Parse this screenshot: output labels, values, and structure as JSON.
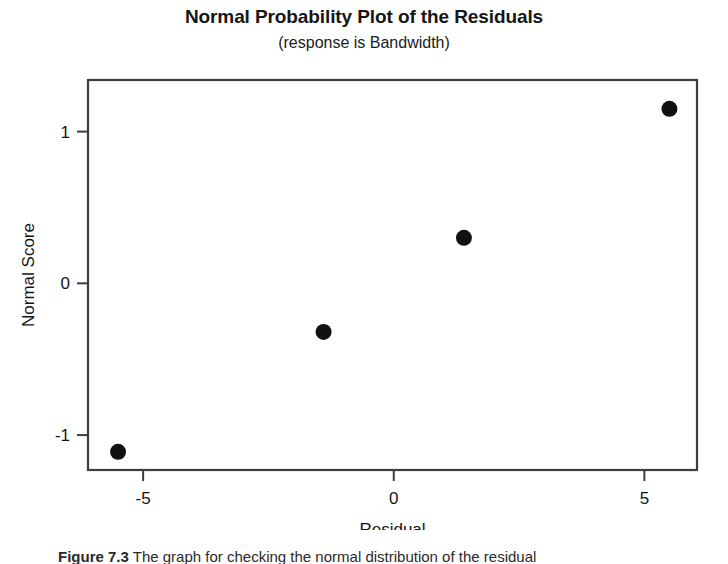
{
  "chart_data": {
    "type": "scatter",
    "title": "Normal Probability Plot of the Residuals",
    "subtitle": "(response is Bandwidth)",
    "xlabel": "Residual",
    "ylabel": "Normal Score",
    "xlim": [
      -6.1,
      6.05
    ],
    "ylim": [
      -1.23,
      1.34
    ],
    "xticks": [
      -5,
      0,
      5
    ],
    "xticklabels": [
      "-5",
      "0",
      "5"
    ],
    "yticks": [
      -1,
      0,
      1
    ],
    "yticklabels": [
      "-1",
      "0",
      "1"
    ],
    "grid": false,
    "legend": "none",
    "marker": "filled-circle",
    "marker_color": "#111111",
    "points": [
      {
        "x": -5.5,
        "y": -1.11
      },
      {
        "x": -1.4,
        "y": -0.32
      },
      {
        "x": 1.4,
        "y": 0.3
      },
      {
        "x": 5.5,
        "y": 1.15
      }
    ],
    "x": [
      -5.5,
      -1.4,
      1.4,
      5.5
    ],
    "values": [
      -1.11,
      -0.32,
      0.3,
      1.15
    ]
  },
  "caption": {
    "label": "Figure 7.3",
    "text": "The graph for checking the normal distribution of the residual"
  }
}
